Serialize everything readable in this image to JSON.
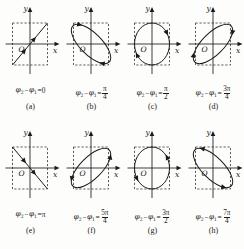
{
  "figure": {
    "background_color": "#fdfdfb",
    "ink_color": "#1a1a1a",
    "axis_labels": {
      "x": "x",
      "y": "y",
      "origin": "O"
    },
    "phase_symbol_1": "φ",
    "phase_symbol_2": "φ",
    "minus_sign": "−",
    "equals_sign": "=",
    "pi": "π"
  },
  "panels": [
    {
      "id": "a",
      "label": "(a)",
      "phase_lhs_1": "φ",
      "phase_sub_1": "2",
      "phase_lhs_2": "φ",
      "phase_sub_2": "1",
      "value_text": "0",
      "value_numerator": "",
      "value_denominator": "",
      "is_fraction": false,
      "curve_type": "line",
      "tilt_deg": -45,
      "direction": "up-right",
      "phase_radians": 0
    },
    {
      "id": "b",
      "label": "(b)",
      "phase_lhs_1": "φ",
      "phase_sub_1": "2",
      "phase_lhs_2": "φ",
      "phase_sub_2": "1",
      "value_text": "",
      "value_numerator": "π",
      "value_denominator": "4",
      "is_fraction": true,
      "curve_type": "ellipse",
      "tilt_deg": -45,
      "direction": "clockwise",
      "phase_radians": 0.7854
    },
    {
      "id": "c",
      "label": "(c)",
      "phase_lhs_1": "φ",
      "phase_sub_1": "2",
      "phase_lhs_2": "φ",
      "phase_sub_2": "1",
      "value_text": "",
      "value_numerator": "π",
      "value_denominator": "2",
      "is_fraction": true,
      "curve_type": "ellipse",
      "tilt_deg": 0,
      "direction": "clockwise",
      "phase_radians": 1.5708
    },
    {
      "id": "d",
      "label": "(d)",
      "phase_lhs_1": "φ",
      "phase_sub_1": "2",
      "phase_lhs_2": "φ",
      "phase_sub_2": "1",
      "value_text": "",
      "value_numerator": "3π",
      "value_denominator": "4",
      "is_fraction": true,
      "curve_type": "ellipse",
      "tilt_deg": 45,
      "direction": "clockwise",
      "phase_radians": 2.3562
    },
    {
      "id": "e",
      "label": "(e)",
      "phase_lhs_1": "φ",
      "phase_sub_1": "2",
      "phase_lhs_2": "φ",
      "phase_sub_2": "1",
      "value_text": "π",
      "value_numerator": "",
      "value_denominator": "",
      "is_fraction": false,
      "curve_type": "line",
      "tilt_deg": 45,
      "direction": "down-right",
      "phase_radians": 3.1416
    },
    {
      "id": "f",
      "label": "(f)",
      "phase_lhs_1": "φ",
      "phase_sub_1": "2",
      "phase_lhs_2": "φ",
      "phase_sub_2": "1",
      "value_text": "",
      "value_numerator": "5π",
      "value_denominator": "4",
      "is_fraction": true,
      "curve_type": "ellipse",
      "tilt_deg": 45,
      "direction": "counterclockwise",
      "phase_radians": 3.927
    },
    {
      "id": "g",
      "label": "(g)",
      "phase_lhs_1": "φ",
      "phase_sub_1": "2",
      "phase_lhs_2": "φ",
      "phase_sub_2": "1",
      "value_text": "",
      "value_numerator": "3π",
      "value_denominator": "2",
      "is_fraction": true,
      "curve_type": "ellipse",
      "tilt_deg": 0,
      "direction": "counterclockwise",
      "phase_radians": 4.7124
    },
    {
      "id": "h",
      "label": "(h)",
      "phase_lhs_1": "φ",
      "phase_sub_1": "2",
      "phase_lhs_2": "φ",
      "phase_sub_2": "1",
      "value_text": "",
      "value_numerator": "7π",
      "value_denominator": "4",
      "is_fraction": true,
      "curve_type": "ellipse",
      "tilt_deg": -45,
      "direction": "counterclockwise",
      "phase_radians": 5.4978
    }
  ]
}
